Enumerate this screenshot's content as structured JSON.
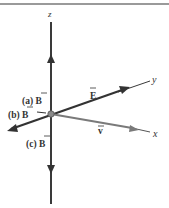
{
  "colors": {
    "axis": "#3a3a3a",
    "vector_dark": "#333333",
    "vector_gray": "#7a7a7a",
    "rule": "#9a9a9a",
    "origin": "#8a8a8a"
  },
  "axes": {
    "z_label": "z",
    "y_label": "y",
    "x_label": "x"
  },
  "vectors": {
    "a_label": "(a) B",
    "b_label": "(b) B",
    "c_label": "(c) B",
    "E_label": "E",
    "v_label": "v"
  },
  "geometry": {
    "origin": [
      51,
      114
    ],
    "z_top": [
      51,
      22
    ],
    "z_bottom": [
      51,
      204
    ],
    "y_end": [
      150,
      81
    ],
    "y_neg_end": [
      8,
      130
    ],
    "x_end": [
      150,
      132
    ]
  }
}
